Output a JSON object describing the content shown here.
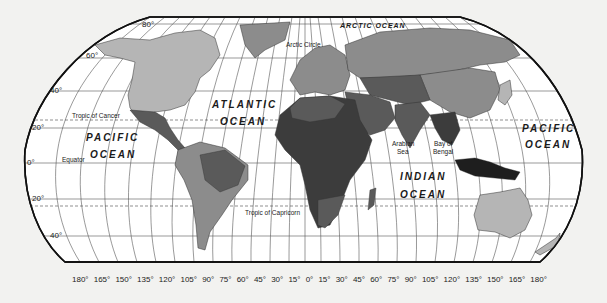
{
  "map": {
    "title": "World Map",
    "colors": {
      "background": "#f2f2f0",
      "ocean": "#ffffff",
      "outline": "#111111",
      "grid": "#444444",
      "land_light": "#b5b5b5",
      "land_mid": "#8c8c8c",
      "land_dark": "#5a5a5a",
      "land_darker": "#3c3c3c",
      "land_darkest": "#1e1e1e"
    },
    "ocean_labels": {
      "arctic": "ARCTIC OCEAN",
      "atlantic_1": "ATLANTIC",
      "atlantic_2": "OCEAN",
      "pacific_w_1": "PACIFIC",
      "pacific_w_2": "OCEAN",
      "pacific_e_1": "PACIFIC",
      "pacific_e_2": "OCEAN",
      "indian_1": "INDIAN",
      "indian_2": "OCEAN"
    },
    "sea_labels": {
      "arabian_1": "Arabian",
      "arabian_2": "Sea",
      "bengal_1": "Bay of",
      "bengal_2": "Bengal"
    },
    "line_labels": {
      "arctic_circle": "Arctic Circle",
      "tropic_cancer": "Tropic of Cancer",
      "equator": "Equator",
      "tropic_capricorn": "Tropic of Capricorn"
    },
    "latitude_labels": [
      "80°",
      "60°",
      "40°",
      "20°",
      "0°",
      "20°",
      "40°"
    ],
    "longitude_labels": [
      "180°",
      "165°",
      "150°",
      "135°",
      "120°",
      "105°",
      "90°",
      "75°",
      "60°",
      "45°",
      "30°",
      "15°",
      "0°",
      "15°",
      "30°",
      "45°",
      "60°",
      "75°",
      "90°",
      "105°",
      "120°",
      "135°",
      "150°",
      "165°",
      "180°"
    ]
  }
}
